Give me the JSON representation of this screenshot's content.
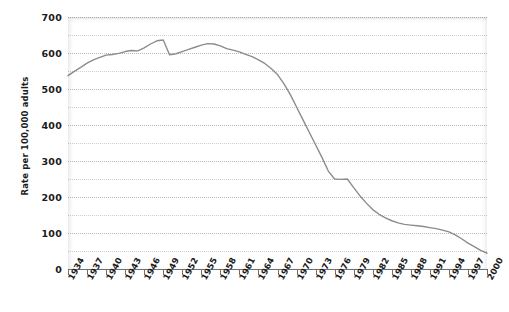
{
  "chart_data": {
    "type": "line",
    "title": "",
    "xlabel": "",
    "ylabel": "Rate per 100,000 adults",
    "xlim": [
      1934,
      2000
    ],
    "ylim": [
      0,
      700
    ],
    "ytick_values": [
      0,
      100,
      200,
      300,
      400,
      500,
      600,
      700
    ],
    "ytick_labels": [
      "0",
      "100",
      "200",
      "300",
      "400",
      "500",
      "600",
      "700"
    ],
    "minor_gridline_values": [
      50,
      150,
      250,
      350,
      450,
      550,
      650
    ],
    "grid": true,
    "legend": "none",
    "xtick_labels": [
      "1934",
      "1937",
      "1940",
      "1943",
      "1946",
      "1949",
      "1952",
      "1955",
      "1958",
      "1961",
      "1964",
      "1967",
      "1970",
      "1973",
      "1976",
      "1979",
      "1982",
      "1985",
      "1988",
      "1991",
      "1994",
      "1997",
      "2000"
    ],
    "xtick_values": [
      1934,
      1937,
      1940,
      1943,
      1946,
      1949,
      1952,
      1955,
      1958,
      1961,
      1964,
      1967,
      1970,
      1973,
      1976,
      1979,
      1982,
      1985,
      1988,
      1991,
      1994,
      1997,
      2000
    ],
    "series": [
      {
        "name": "Rate per 100,000 adults",
        "color": "#8c8c8c",
        "x": [
          1934,
          1935,
          1936,
          1937,
          1938,
          1939,
          1940,
          1941,
          1942,
          1943,
          1944,
          1945,
          1946,
          1947,
          1948,
          1949,
          1950,
          1951,
          1952,
          1953,
          1954,
          1955,
          1956,
          1957,
          1958,
          1959,
          1960,
          1961,
          1962,
          1963,
          1964,
          1965,
          1966,
          1967,
          1968,
          1969,
          1970,
          1971,
          1972,
          1973,
          1974,
          1975,
          1976,
          1977,
          1978,
          1979,
          1980,
          1981,
          1982,
          1983,
          1984,
          1985,
          1986,
          1987,
          1988,
          1989,
          1990,
          1991,
          1992,
          1993,
          1994,
          1995,
          1996,
          1997,
          1998,
          1999,
          2000
        ],
        "y": [
          537,
          549,
          560,
          572,
          581,
          588,
          594,
          596,
          599,
          604,
          607,
          606,
          614,
          625,
          634,
          636,
          595,
          598,
          604,
          610,
          616,
          622,
          626,
          625,
          620,
          612,
          608,
          603,
          596,
          590,
          581,
          571,
          557,
          540,
          515,
          485,
          450,
          415,
          380,
          345,
          310,
          272,
          250,
          249,
          250,
          226,
          203,
          183,
          165,
          152,
          142,
          134,
          128,
          124,
          122,
          120,
          118,
          115,
          112,
          108,
          103,
          95,
          84,
          72,
          62,
          52,
          44
        ]
      }
    ]
  },
  "axes": {
    "y_title": "Rate per 100,000 adults"
  }
}
